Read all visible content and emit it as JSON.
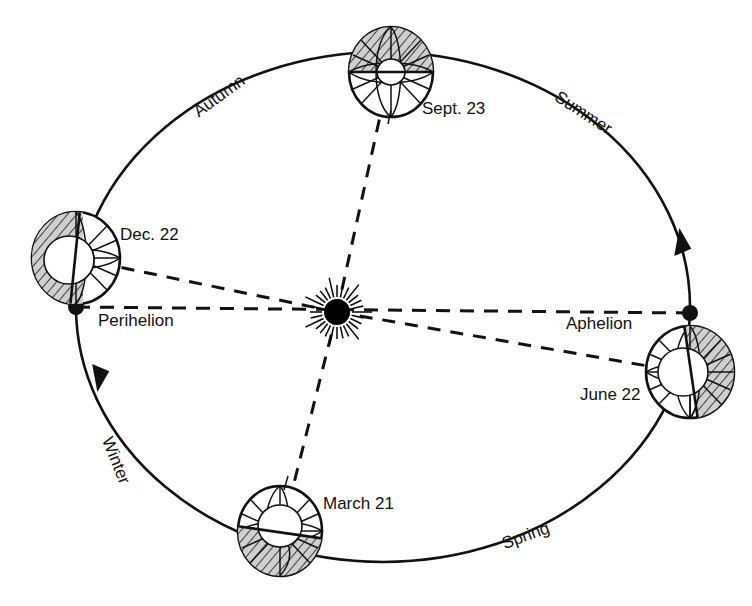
{
  "diagram": {
    "center_body": {
      "name": "sun",
      "label": "",
      "cx": 337,
      "cy": 312,
      "core_radius": 13,
      "ray_count": 28,
      "ray_inner": 15,
      "ray_outer": 31,
      "color": "#000000"
    },
    "orbit": {
      "cx": 383,
      "cy": 307,
      "rx": 307,
      "ry": 255,
      "stroke": "#111111",
      "direction": "counterclockwise"
    },
    "apsides": [
      {
        "name": "perihelion",
        "label": "Perihelion",
        "dot_x": 76,
        "dot_y": 307,
        "label_x": 98,
        "label_y": 322,
        "dot_radius": 8
      },
      {
        "name": "aphelion",
        "label": "Aphelion",
        "dot_x": 690,
        "dot_y": 313,
        "label_x": 566,
        "label_y": 325,
        "dot_radius": 8
      }
    ],
    "apsidal_line": {
      "x1": 76,
      "y1": 307,
      "x2": 690,
      "y2": 313
    },
    "earth_positions": [
      {
        "name": "earth-sept-23",
        "label": "Sept. 23",
        "cx": 391,
        "cy": 72,
        "rx": 42,
        "ry": 45,
        "inner_r": 13,
        "terminator_angle_deg": 0,
        "shaded_side": "top",
        "axis_tilt_deg": 12,
        "label_x": 422,
        "label_y": 110
      },
      {
        "name": "earth-dec-22",
        "label": "Dec. 22",
        "cx": 76,
        "cy": 258,
        "rx": 44,
        "ry": 46,
        "inner_r": 14,
        "terminator_angle_deg": 97,
        "shaded_side": "left",
        "axis_tilt_deg": 12,
        "label_x": 120,
        "label_y": 236
      },
      {
        "name": "earth-june-22",
        "label": "June 22",
        "cx": 690,
        "cy": 372,
        "rx": 44,
        "ry": 46,
        "inner_r": 14,
        "terminator_angle_deg": 83,
        "shaded_side": "right",
        "axis_tilt_deg": -12,
        "label_x": 580,
        "label_y": 396
      },
      {
        "name": "earth-march-21",
        "label": "March 21",
        "cx": 280,
        "cy": 531,
        "rx": 42,
        "ry": 45,
        "inner_r": 13,
        "terminator_angle_deg": 8,
        "shaded_side": "bottom",
        "axis_tilt_deg": 12,
        "label_x": 323,
        "label_y": 505
      }
    ],
    "axis_lines": [
      {
        "name": "axis-sept-23",
        "x1": 337,
        "y1": 312,
        "x2": 381,
        "y2": 110
      },
      {
        "name": "axis-march-21",
        "x1": 337,
        "y1": 312,
        "x2": 291,
        "y2": 495
      },
      {
        "name": "axis-dec-22",
        "x1": 337,
        "y1": 312,
        "x2": 114,
        "y2": 266
      },
      {
        "name": "axis-june-22",
        "x1": 337,
        "y1": 312,
        "x2": 648,
        "y2": 366
      }
    ],
    "seasons": [
      {
        "name": "season-autumn",
        "label": "Autumn",
        "x": 196,
        "y": 114,
        "rotate": -36
      },
      {
        "name": "season-summer",
        "label": "Summer",
        "x": 556,
        "y": 96,
        "rotate": 33
      },
      {
        "name": "season-winter",
        "label": "Winter",
        "x": 106,
        "y": 438,
        "rotate": 68
      },
      {
        "name": "season-spring",
        "label": "Spring",
        "x": 503,
        "y": 545,
        "rotate": -20
      }
    ],
    "direction_arrows": [
      {
        "name": "arrow-ascending-right",
        "x": 681,
        "y": 233,
        "rotate": -19
      },
      {
        "name": "arrow-descending-left",
        "x": 99,
        "y": 378,
        "rotate": 152
      }
    ]
  }
}
